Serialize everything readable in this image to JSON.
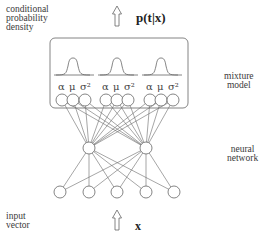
{
  "labels": {
    "output_desc": [
      "conditional",
      "probability",
      "density"
    ],
    "output_var": "p(t|x)",
    "mixture": [
      "mixture",
      "model"
    ],
    "network": [
      "neural",
      "network"
    ],
    "input_desc": [
      "input",
      "vector"
    ],
    "input_var": "x"
  },
  "mixture_components": [
    {
      "params": [
        "α",
        "μ",
        "σ²"
      ]
    },
    {
      "params": [
        "α",
        "μ",
        "σ²"
      ]
    },
    {
      "params": [
        "α",
        "μ",
        "σ²"
      ]
    }
  ],
  "network": {
    "input_nodes": 5,
    "hidden_nodes": 2,
    "output_nodes": 9,
    "connectivity": "fully-connected"
  },
  "colors": {
    "line": "#555555",
    "node_fill": "#ffffff",
    "text": "#333333"
  }
}
